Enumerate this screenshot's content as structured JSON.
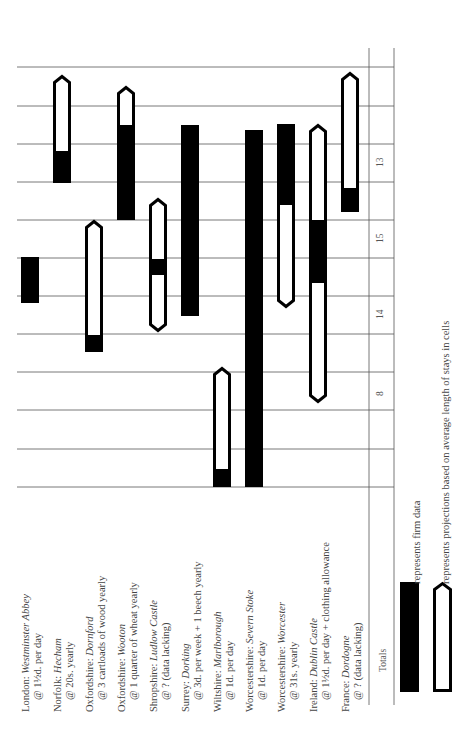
{
  "chart_data": {
    "type": "bar",
    "orientation": "horizontal (figure printed rotated 90° counter-clockwise)",
    "title": "",
    "xlabel": "",
    "ylabel": "",
    "grid": true,
    "grid_divisions": 11,
    "categories": [
      {
        "region": "London:",
        "place": "Westminster Abbey",
        "rate": "@ 1½d. per day"
      },
      {
        "region": "Norfolk:",
        "place": "Hecham",
        "rate": "@ 20s. yearly"
      },
      {
        "region": "Oxfordshire:",
        "place": "Dornford",
        "rate": "@ 3 cartloads of wood yearly"
      },
      {
        "region": "Oxfordshire:",
        "place": "Wooton",
        "rate": "@ 1 quarter of wheat yearly"
      },
      {
        "region": "Shropshire:",
        "place": "Ludlow Castle",
        "rate": "@ ? (data lacking)"
      },
      {
        "region": "Surrey:",
        "place": "Dorking",
        "rate": "@ 3d. per week + 1 beech yearly"
      },
      {
        "region": "Wiltshire:",
        "place": "Marlborough",
        "rate": "@ 1d. per day"
      },
      {
        "region": "Worcestershire:",
        "place": "Severn Stoke",
        "rate": "@ 1d. per day"
      },
      {
        "region": "Worcestershire:",
        "place": "Worcester",
        "rate": "@ 31s. yearly"
      },
      {
        "region": "Ireland:",
        "place": "Dublin Castle",
        "rate": "@ 1½d. per day + clothing allowance"
      },
      {
        "region": "France:",
        "place": "Dordogne",
        "rate": "@ ? (data lacking)"
      }
    ],
    "series": [
      {
        "name": "firm data",
        "style": "solid black",
        "segments_in_grid_units": [
          [
            4.8,
            6.0
          ],
          [
            8.1,
            8.9
          ],
          [
            3.5,
            3.9
          ],
          [
            7.0,
            9.5
          ],
          [
            5.6,
            6.0
          ],
          [
            4.5,
            9.5
          ],
          [
            0.0,
            0.5
          ],
          [
            0.0,
            9.4
          ],
          [
            7.5,
            9.5
          ],
          [
            5.3,
            7.0
          ],
          [
            7.2,
            7.8
          ]
        ]
      },
      {
        "name": "projection",
        "style": "white with black outline, pointed end",
        "segments_in_grid_units": [
          [
            null,
            null
          ],
          [
            8.1,
            10.9
          ],
          [
            3.5,
            7.0
          ],
          [
            7.0,
            10.5
          ],
          [
            4.1,
            7.6
          ],
          [
            null,
            null
          ],
          [
            0.5,
            3.2
          ],
          [
            null,
            null
          ],
          [
            4.7,
            7.5
          ],
          [
            2.2,
            7.5
          ],
          [
            7.8,
            11.0
          ]
        ]
      }
    ],
    "totals_label": "Totals",
    "totals": [
      {
        "value": "13",
        "band": 0
      },
      {
        "value": "15",
        "band": 1
      },
      {
        "value": "14",
        "band": 2
      },
      {
        "value": "8",
        "band": 3
      }
    ],
    "legend": [
      {
        "symbol": "solid-black-bar",
        "text": "represents firm data"
      },
      {
        "symbol": "outlined-arrow-bar",
        "text": "represents projections based on average length of stays in cells"
      }
    ],
    "legend_position": "bottom-right (rotated)"
  },
  "geometry": {
    "grid_y": [
      67,
      106,
      144,
      182,
      220,
      258,
      296,
      334,
      372,
      410,
      449,
      487
    ],
    "grid_x_left": 17,
    "chart_right_x": 369,
    "totals_right_x": 394,
    "row_x": [
      21,
      53,
      85,
      117,
      149,
      181,
      213,
      245,
      277,
      309,
      341
    ],
    "bar_w": 18,
    "bars": [
      {
        "black": [
          [
            257,
            303
          ]
        ]
      },
      {
        "outline": [
          75,
          183
        ],
        "tip": "top",
        "black": [
          [
            151,
            183
          ]
        ]
      },
      {
        "outline": [
          220,
          352
        ],
        "tip": "top",
        "black": [
          [
            335,
            352
          ]
        ]
      },
      {
        "outline": [
          86,
          220
        ],
        "tip": "top",
        "black": [
          [
            125,
            220
          ]
        ]
      },
      {
        "outline": [
          198,
          332
        ],
        "tip": "both",
        "black": [
          [
            259,
            275
          ]
        ]
      },
      {
        "black": [
          [
            125,
            316
          ]
        ]
      },
      {
        "outline": [
          367,
          487
        ],
        "tip": "top",
        "black": [
          [
            469,
            487
          ]
        ]
      },
      {
        "black": [
          [
            130,
            487
          ]
        ]
      },
      {
        "outline": [
          202,
          308
        ],
        "tip": "bottom",
        "black": [
          [
            124,
            202
          ]
        ]
      },
      {
        "outline": [
          124,
          403
        ],
        "tip": "both",
        "black": [
          [
            220,
            283
          ]
        ]
      },
      {
        "outline": [
          72,
          212
        ],
        "tip": "top",
        "black": [
          [
            188,
            212
          ]
        ]
      }
    ],
    "totals_y": [
      162,
      238,
      314,
      391
    ]
  }
}
